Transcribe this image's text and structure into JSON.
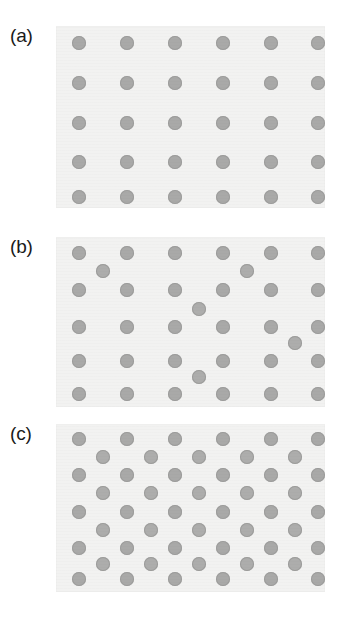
{
  "figure": {
    "background_color": "#ffffff",
    "panel_background_color": "#f2f2f1",
    "dot_color": "#a9a9a8",
    "dot_edge_color": "#9d9d9c",
    "label_color": "#1a1a1a"
  },
  "chart_data": {
    "type": "scatter",
    "title": "",
    "subtitle": "",
    "xlabel": "",
    "ylabel": "",
    "grid": false,
    "legend_position": "none",
    "marker": "circle",
    "marker_diameter_px": 14,
    "panel_width_px": 269,
    "panels": [
      {
        "label": "(a)",
        "description": "Regular square lattice, 6 columns x 5 rows",
        "height_px": 182,
        "xlim": [
          0,
          269
        ],
        "ylim": [
          0,
          182
        ],
        "series": [
          {
            "name": "lattice",
            "x": [
              23,
              71,
              119,
              167,
              215,
              262,
              23,
              71,
              119,
              167,
              215,
              262,
              23,
              71,
              119,
              167,
              215,
              262,
              23,
              71,
              119,
              167,
              215,
              262,
              23,
              71,
              119,
              167,
              215,
              262
            ],
            "y": [
              17,
              17,
              17,
              17,
              17,
              17,
              57,
              57,
              57,
              57,
              57,
              57,
              97,
              97,
              97,
              97,
              97,
              97,
              136,
              136,
              136,
              136,
              136,
              136,
              171,
              171,
              171,
              171,
              171,
              171
            ]
          }
        ]
      },
      {
        "label": "(b)",
        "description": "Square lattice with four interstitial defect particles",
        "height_px": 170,
        "xlim": [
          0,
          269
        ],
        "ylim": [
          0,
          170
        ],
        "series": [
          {
            "name": "lattice",
            "x": [
              23,
              71,
              119,
              167,
              215,
              262,
              23,
              71,
              119,
              167,
              215,
              262,
              23,
              71,
              119,
              167,
              215,
              262,
              23,
              71,
              119,
              167,
              215,
              262,
              23,
              71,
              119,
              167,
              215,
              262
            ],
            "y": [
              16,
              16,
              16,
              16,
              16,
              16,
              53,
              53,
              53,
              53,
              53,
              53,
              90,
              90,
              90,
              90,
              90,
              90,
              124,
              124,
              124,
              124,
              124,
              124,
              157,
              157,
              157,
              157,
              157,
              157
            ]
          },
          {
            "name": "interstitials",
            "x": [
              47,
              191,
              143,
              239,
              143
            ],
            "y": [
              34,
              34,
              72,
              106,
              140
            ]
          }
        ]
      },
      {
        "label": "(c)",
        "description": "Interleaved lattice: five primary rows alternating with four half-pitch offset rows",
        "height_px": 168,
        "xlim": [
          0,
          269
        ],
        "ylim": [
          0,
          168
        ],
        "series": [
          {
            "name": "primary-rows",
            "x": [
              23,
              71,
              119,
              167,
              215,
              262,
              23,
              71,
              119,
              167,
              215,
              262,
              23,
              71,
              119,
              167,
              215,
              262,
              23,
              71,
              119,
              167,
              215,
              262,
              23,
              71,
              119,
              167,
              215,
              262
            ],
            "y": [
              15,
              15,
              15,
              15,
              15,
              15,
              51,
              51,
              51,
              51,
              51,
              51,
              88,
              88,
              88,
              88,
              88,
              88,
              124,
              124,
              124,
              124,
              124,
              124,
              155,
              155,
              155,
              155,
              155,
              155
            ]
          },
          {
            "name": "offset-rows",
            "x": [
              47,
              95,
              143,
              191,
              239,
              47,
              95,
              143,
              191,
              239,
              47,
              95,
              143,
              191,
              239,
              47,
              95,
              143,
              191,
              239
            ],
            "y": [
              33,
              33,
              33,
              33,
              33,
              69,
              69,
              69,
              69,
              69,
              106,
              106,
              106,
              106,
              106,
              140,
              140,
              140,
              140,
              140
            ]
          }
        ]
      }
    ]
  },
  "panels": [
    {
      "label": "(a)",
      "top": 26,
      "label_top": 26,
      "canvas_top": 26,
      "height": 182
    },
    {
      "label": "(b)",
      "top": 237,
      "label_top": 237,
      "canvas_top": 237,
      "height": 170
    },
    {
      "label": "(c)",
      "top": 424,
      "label_top": 424,
      "canvas_top": 424,
      "height": 168
    }
  ]
}
